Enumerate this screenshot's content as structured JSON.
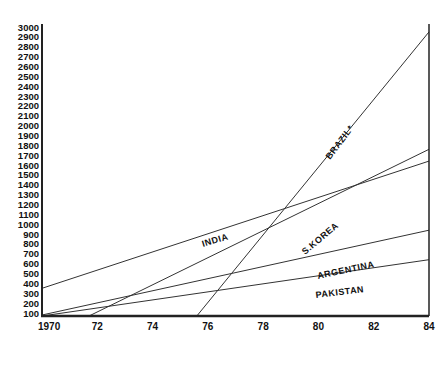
{
  "chart_data": {
    "type": "line",
    "title": "",
    "xlabel": "",
    "ylabel": "",
    "x_ticks": [
      "1970",
      "72",
      "74",
      "76",
      "78",
      "80",
      "82",
      "84"
    ],
    "x_tick_values": [
      1970,
      1972,
      1974,
      1976,
      1978,
      1980,
      1982,
      1984
    ],
    "y_ticks": [
      "100",
      "200",
      "300",
      "400",
      "500",
      "600",
      "700",
      "800",
      "900",
      "1000",
      "1100",
      "1200",
      "1300",
      "1400",
      "1500",
      "1600",
      "1700",
      "1800",
      "1900",
      "2000",
      "2100",
      "2200",
      "2300",
      "2400",
      "2500",
      "2600",
      "2700",
      "2800",
      "2900",
      "3000"
    ],
    "xlim": [
      1970,
      1984
    ],
    "ylim": [
      60,
      3000
    ],
    "grid": false,
    "legend": "inline labels on lines",
    "series": [
      {
        "name": "INDIA",
        "points": [
          [
            1970,
            350
          ],
          [
            1984,
            1640
          ]
        ]
      },
      {
        "name": "BRAZIL*",
        "points": [
          [
            1975.6,
            60
          ],
          [
            1984,
            2950
          ]
        ]
      },
      {
        "name": "S.KOREA",
        "points": [
          [
            1971.7,
            60
          ],
          [
            1984,
            1760
          ]
        ]
      },
      {
        "name": "ARGENTINA",
        "points": [
          [
            1970,
            80
          ],
          [
            1984,
            940
          ]
        ]
      },
      {
        "name": "PAKISTAN",
        "points": [
          [
            1970,
            70
          ],
          [
            1984,
            640
          ]
        ]
      }
    ]
  },
  "labels": {
    "india": "INDIA",
    "brazil": "BRAZIL*",
    "skorea": "S.KOREA",
    "argentina": "ARGENTINA",
    "pakistan": "PAKISTAN"
  },
  "colors": {
    "axis": "#222222",
    "line": "#333333",
    "text": "#111111"
  }
}
